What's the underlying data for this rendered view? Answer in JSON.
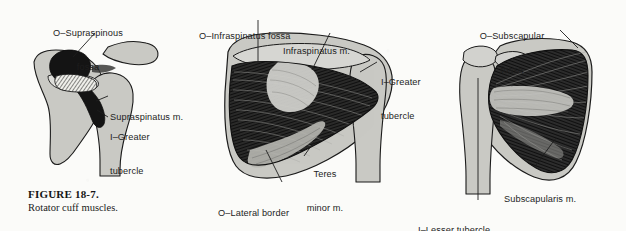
{
  "figure": {
    "caption_number": "FIGURE 18-7.",
    "caption_text": "Rotator cuff muscles.",
    "background_color": "#fbfbf9",
    "ink_color": "#1d1d1d",
    "bone_fill": "#c9c9c4",
    "muscle_fill": "#111111"
  },
  "panels": [
    {
      "id": "panel-supraspinatus",
      "view": "Supraspinatus (superior view)",
      "labels": [
        {
          "id": "supraspinous-fossa",
          "line1": "O–Supraspinous",
          "line2": "fossa"
        },
        {
          "id": "supraspinatus-muscle",
          "line1": "Supraspinatus m.",
          "line2": ""
        },
        {
          "id": "greater-tubercle",
          "line1": "I–Greater",
          "line2": "tubercle"
        }
      ]
    },
    {
      "id": "panel-infraspinatus",
      "view": "Infraspinatus and teres minor (posterior view)",
      "labels": [
        {
          "id": "infraspinatus-fossa",
          "line1": "O–Infraspinatus fossa",
          "line2": ""
        },
        {
          "id": "infraspinatus-muscle",
          "line1": "Infraspinatus m.",
          "line2": ""
        },
        {
          "id": "greater-tubercle",
          "line1": "I–Greater",
          "line2": "tubercle"
        },
        {
          "id": "teres-minor-muscle",
          "line1": "Teres",
          "line2": "minor m."
        },
        {
          "id": "lateral-border",
          "line1": "O–Lateral border",
          "line2": ""
        }
      ]
    },
    {
      "id": "panel-subscapularis",
      "view": "Subscapularis (anterior view)",
      "labels": [
        {
          "id": "subscapular-fossa",
          "line1": "O–Subscapular",
          "line2": "fossa"
        },
        {
          "id": "subscapularis-muscle",
          "line1": "Subscapularis m.",
          "line2": ""
        },
        {
          "id": "lesser-tubercle",
          "line1": "I–Lesser tubercle",
          "line2": ""
        }
      ]
    }
  ]
}
